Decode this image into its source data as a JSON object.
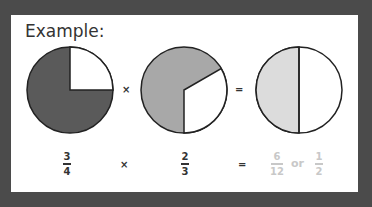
{
  "title": "Example:",
  "colors": {
    "background": "#4b4b4b",
    "panel": "#ffffff",
    "pie1_fill": "#5a5a5a",
    "pie2_fill": "#a8a8a8",
    "pie3_fill": "#dcdcdc",
    "faded_text": "#c8c8c8"
  },
  "pies": [
    {
      "name": "three-quarters",
      "shaded_fraction": "3/4"
    },
    {
      "name": "two-thirds",
      "shaded_fraction": "2/3"
    },
    {
      "name": "one-half",
      "shaded_fraction": "1/2"
    }
  ],
  "operators": {
    "multiply": "×",
    "equals": "="
  },
  "equation": {
    "left": {
      "numerator": "3",
      "denominator": "4"
    },
    "right": {
      "numerator": "2",
      "denominator": "3"
    },
    "result": {
      "numerator": "6",
      "denominator": "12"
    },
    "or_label": "or",
    "simplified": {
      "numerator": "1",
      "denominator": "2"
    }
  }
}
